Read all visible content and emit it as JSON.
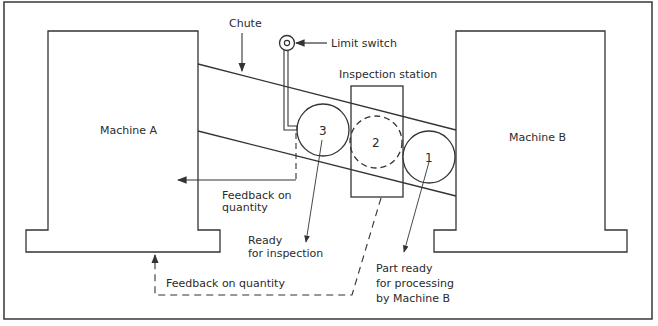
{
  "diagram": {
    "type": "process-flow",
    "colors": {
      "line": "#333333",
      "background": "#ffffff",
      "text": "#2b2b2b"
    },
    "machines": [
      {
        "id": "machine-a",
        "label": "Machine A"
      },
      {
        "id": "machine-b",
        "label": "Machine B"
      }
    ],
    "components": {
      "chute": "Chute",
      "limit_switch": "Limit switch",
      "inspection_station": "Inspection station"
    },
    "parts": [
      {
        "number": "3",
        "state": "waiting"
      },
      {
        "number": "2",
        "state": "being inspected (dashed)"
      },
      {
        "number": "1",
        "state": "ready"
      }
    ],
    "annotations": {
      "feedback_top_line1": "Feedback on",
      "feedback_top_line2": "quantity",
      "ready_line1": "Ready",
      "ready_line2": "for inspection",
      "feedback_bottom": "Feedback on quantity",
      "part_ready_line1": "Part ready",
      "part_ready_line2": "for processing",
      "part_ready_line3": "by Machine B"
    }
  }
}
